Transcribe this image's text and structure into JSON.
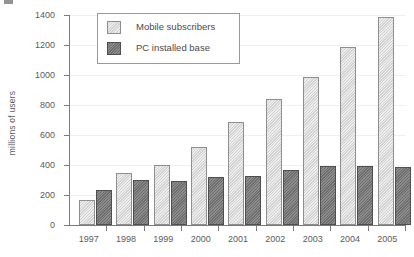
{
  "chart_data": {
    "type": "bar",
    "title": "",
    "xlabel": "",
    "ylabel": "millions of users",
    "ylim": [
      0,
      1400
    ],
    "ytick_step": 200,
    "yticks": [
      0,
      200,
      400,
      600,
      800,
      1000,
      1200,
      1400
    ],
    "grid": true,
    "legend_position": "top-left-inside",
    "categories": [
      "1997",
      "1998",
      "1999",
      "2000",
      "2001",
      "2002",
      "2003",
      "2004",
      "2005"
    ],
    "series": [
      {
        "name": "Mobile subscribers",
        "color": "#d4d4d4",
        "edge_color": "#8f8f8f",
        "values": [
          170,
          345,
          400,
          520,
          685,
          840,
          990,
          1185,
          1385
        ]
      },
      {
        "name": "PC installed base",
        "color": "#707070",
        "edge_color": "#4f4f4f",
        "values": [
          235,
          300,
          292,
          320,
          330,
          365,
          395,
          395,
          385
        ]
      }
    ]
  },
  "axis": {
    "y_title": "millions of users",
    "y_tick_labels": [
      "1400",
      "1200",
      "1000",
      "800",
      "600",
      "400",
      "200",
      "0"
    ],
    "x_tick_labels": [
      "1997",
      "1998",
      "1999",
      "2000",
      "2001",
      "2002",
      "2003",
      "2004",
      "2005"
    ]
  },
  "legend": {
    "entries": [
      {
        "label": "Mobile subscribers",
        "swatch": "light-gray-swatch"
      },
      {
        "label": "PC installed base",
        "swatch": "dark-gray-swatch"
      }
    ]
  }
}
